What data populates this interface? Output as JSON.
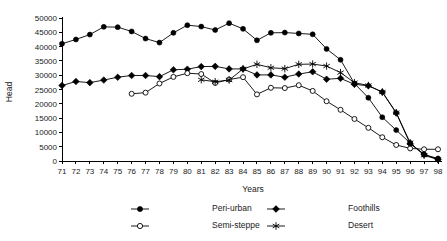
{
  "chart_data": {
    "type": "line",
    "title": "",
    "xlabel": "Years",
    "ylabel": "Head",
    "xlim": [
      71,
      98
    ],
    "ylim": [
      0,
      50000
    ],
    "ytick_step": 5000,
    "grid": false,
    "legend_position": "bottom",
    "x": [
      71,
      72,
      73,
      74,
      75,
      76,
      77,
      78,
      79,
      80,
      81,
      82,
      83,
      84,
      85,
      86,
      87,
      88,
      89,
      90,
      91,
      92,
      93,
      94,
      95,
      96,
      97,
      98
    ],
    "xtick_labels": [
      "71",
      "72",
      "73",
      "74",
      "75",
      "76",
      "77",
      "78",
      "79",
      "80",
      "81",
      "82",
      "83",
      "84",
      "85",
      "86",
      "87",
      "88",
      "89",
      "90",
      "91",
      "92",
      "93",
      "94",
      "95",
      "96",
      "97",
      "98"
    ],
    "ytick_labels": [
      "0",
      "5000",
      "10000",
      "15000",
      "20000",
      "25000",
      "30000",
      "35000",
      "40000",
      "45000",
      "50000"
    ],
    "ytick_values": [
      0,
      5000,
      10000,
      15000,
      20000,
      25000,
      30000,
      35000,
      40000,
      45000,
      50000
    ],
    "series": [
      {
        "name": "Peri-urban",
        "marker": "filled-circle",
        "color": "#000000",
        "x": [
          71,
          72,
          73,
          74,
          75,
          76,
          77,
          78,
          79,
          80,
          81,
          82,
          83,
          84,
          85,
          86,
          87,
          88,
          89,
          90,
          91,
          92,
          93,
          94,
          95,
          96,
          97,
          98
        ],
        "values": [
          41000,
          42500,
          44200,
          46900,
          46800,
          45300,
          42800,
          41400,
          44800,
          47500,
          47000,
          45800,
          48200,
          46200,
          42200,
          44800,
          44900,
          44600,
          44300,
          39200,
          35400,
          27100,
          22100,
          15300,
          10800,
          6300,
          2200,
          900
        ]
      },
      {
        "name": "Foothills",
        "marker": "filled-diamond",
        "color": "#000000",
        "x": [
          71,
          72,
          73,
          74,
          75,
          76,
          77,
          78,
          79,
          80,
          81,
          82,
          83,
          84,
          85,
          86,
          87,
          88,
          89,
          90,
          91,
          92,
          93,
          94,
          95,
          96,
          97,
          98
        ],
        "values": [
          26400,
          27800,
          27400,
          28300,
          29300,
          29900,
          29900,
          29500,
          31900,
          32100,
          33000,
          33100,
          32200,
          32200,
          30100,
          30100,
          29300,
          30400,
          31200,
          28600,
          28900,
          26800,
          26300,
          24100,
          16800,
          6000,
          2400,
          500
        ]
      },
      {
        "name": "Semi-steppe",
        "marker": "open-circle",
        "color": "#000000",
        "x": [
          76,
          77,
          78,
          79,
          80,
          81,
          82,
          83,
          84,
          85,
          86,
          87,
          88,
          89,
          90,
          91,
          92,
          93,
          94,
          95,
          96,
          97,
          98
        ],
        "values": [
          23500,
          23900,
          27100,
          29400,
          30700,
          30400,
          27300,
          28500,
          29300,
          23300,
          25600,
          25500,
          26500,
          24500,
          20900,
          17900,
          14700,
          11600,
          8300,
          5600,
          4400,
          4100,
          4100
        ]
      },
      {
        "name": "Desert",
        "marker": "star",
        "color": "#000000",
        "x": [
          81,
          82,
          83,
          84,
          85,
          86,
          87,
          88,
          89,
          90,
          91,
          92,
          93,
          94,
          95,
          96,
          97,
          98
        ],
        "values": [
          28400,
          27700,
          28300,
          32200,
          33800,
          32600,
          32300,
          33800,
          33900,
          33200,
          30900,
          27400,
          26400,
          24100,
          16900,
          6400,
          2000,
          500
        ]
      }
    ]
  },
  "legend": {
    "entries": [
      {
        "label": "Peri-urban",
        "marker": "filled-circle"
      },
      {
        "label": "Foothills",
        "marker": "filled-diamond"
      },
      {
        "label": "Semi-steppe",
        "marker": "open-circle"
      },
      {
        "label": "Desert",
        "marker": "star"
      }
    ]
  }
}
